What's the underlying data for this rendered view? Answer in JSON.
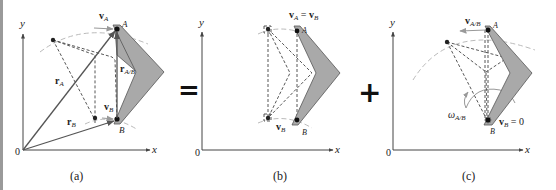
{
  "figure": {
    "operators": {
      "equals": "=",
      "plus": "+"
    },
    "colors": {
      "body_fill": "#a9a9a9",
      "body_stroke": "#555555",
      "vector": "#555555",
      "dashed": "#444444",
      "arc": "#bbbbbb",
      "text": "#222222"
    },
    "panels": [
      {
        "id": "a",
        "caption": "(a)",
        "axis_x": "x",
        "axis_y": "y",
        "origin": "0",
        "labels": {
          "point_A": "A",
          "point_B": "B",
          "v_A": "v",
          "v_A_sub": "A",
          "v_B": "v",
          "v_B_sub": "B",
          "r_A": "r",
          "r_A_sub": "A",
          "r_B": "r",
          "r_B_sub": "B",
          "r_AB": "r",
          "r_AB_sub": "A/B"
        }
      },
      {
        "id": "b",
        "caption": "(b)",
        "axis_x": "x",
        "axis_y": "y",
        "origin": "0",
        "labels": {
          "point_A": "A",
          "point_B": "B",
          "vA_eq_vB": "v",
          "vA_sub": "A",
          "eq": " = ",
          "vB2": "v",
          "vB2_sub": "B",
          "v_B": "v",
          "v_B_sub": "B"
        }
      },
      {
        "id": "c",
        "caption": "(c)",
        "axis_x": "x",
        "axis_y": "y",
        "origin": "0",
        "labels": {
          "point_A": "A",
          "point_B": "B",
          "v_AB": "v",
          "v_AB_sub": "A/B",
          "omega": "ω",
          "omega_sub": "A/B",
          "v_B_zero": "v",
          "v_B_zero_sub": "B",
          "v_B_zero_val": " = 0"
        }
      }
    ]
  }
}
